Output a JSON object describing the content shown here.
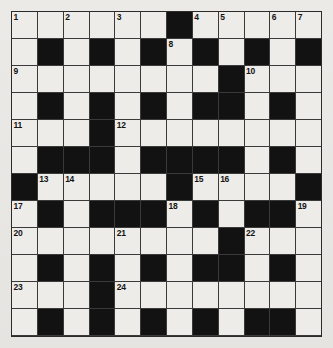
{
  "puzzle": {
    "title": "Crossword Grid",
    "type": "crossword",
    "rows": 12,
    "columns": 12,
    "colors": {
      "paper": "#e9e7e3",
      "cell_fill": "#eeece8",
      "block_fill": "#121212",
      "grid_line": "#3a3a3a",
      "border": "#2b2b2b",
      "number_text": "#141414"
    },
    "legend": {
      "block_symbol": "#",
      "open_symbol": "."
    },
    "grid": [
      "......#.....",
      ".#.#.#.#.#.#",
      "........#...",
      ".#.#.#.#.#.#",
      "...#........",
      ".###.#.###.#",
      "#.....#.....",
      ".#.###.#.##.",
      "........#...",
      ".#.#.#.##.#.",
      "...#........",
      ".#.#.#.#.#.#",
      "......#....."
    ],
    "grid_rows": [
      {
        "row": 1,
        "cells": ".....   ",
        "pattern": "......#....."
      },
      {
        "row": 2,
        "pattern": ".#.#.#.#.#.#"
      },
      {
        "row": 3,
        "pattern": "........#..."
      },
      {
        "row": 4,
        "pattern": ".#.#.#.#.#.#"
      },
      {
        "row": 5,
        "pattern": "...#........"
      },
      {
        "row": 6,
        "pattern": ".###.#.###.#"
      },
      {
        "row": 7,
        "pattern": "#.....#.....#"
      },
      {
        "row": 8,
        "pattern": ".#.###.#.##."
      },
      {
        "row": 9,
        "pattern": "........#..."
      },
      {
        "row": 10,
        "pattern": ".#.#.#.##.#."
      },
      {
        "row": 11,
        "pattern": "...#........"
      },
      {
        "row": 12,
        "pattern": "......#....."
      }
    ],
    "numbers": [
      {
        "n": 1,
        "row": 1,
        "col": 1
      },
      {
        "n": 2,
        "row": 1,
        "col": 3
      },
      {
        "n": 3,
        "row": 1,
        "col": 5
      },
      {
        "n": 4,
        "row": 1,
        "col": 8
      },
      {
        "n": 5,
        "row": 1,
        "col": 9
      },
      {
        "n": 6,
        "row": 1,
        "col": 11
      },
      {
        "n": 7,
        "row": 1,
        "col": 13
      },
      {
        "n": 8,
        "row": 2,
        "col": 7
      },
      {
        "n": 9,
        "row": 3,
        "col": 1
      },
      {
        "n": 10,
        "row": 3,
        "col": 11
      },
      {
        "n": 11,
        "row": 5,
        "col": 1
      },
      {
        "n": 12,
        "row": 5,
        "col": 5
      },
      {
        "n": 13,
        "row": 7,
        "col": 2
      },
      {
        "n": 14,
        "row": 7,
        "col": 3
      },
      {
        "n": 15,
        "row": 7,
        "col": 8
      },
      {
        "n": 16,
        "row": 7,
        "col": 9
      },
      {
        "n": 17,
        "row": 8,
        "col": 1
      },
      {
        "n": 18,
        "row": 8,
        "col": 7
      },
      {
        "n": 19,
        "row": 8,
        "col": 12
      },
      {
        "n": 20,
        "row": 9,
        "col": 1
      },
      {
        "n": 21,
        "row": 9,
        "col": 5
      },
      {
        "n": 22,
        "row": 9,
        "col": 10
      },
      {
        "n": 23,
        "row": 11,
        "col": 1
      },
      {
        "n": 24,
        "row": 11,
        "col": 5
      },
      {
        "n": 25,
        "row": 12,
        "col": 1
      },
      {
        "n": 26,
        "row": 12,
        "col": 8
      }
    ],
    "cells": [
      [
        {
          "b": false,
          "n": "1"
        },
        {
          "b": false
        },
        {
          "b": false,
          "n": "2"
        },
        {
          "b": false
        },
        {
          "b": false,
          "n": "3"
        },
        {
          "b": false
        },
        {
          "b": true
        },
        {
          "b": false,
          "n": "4"
        },
        {
          "b": false,
          "n": "5"
        },
        {
          "b": false
        },
        {
          "b": false,
          "n": "6"
        },
        {
          "b": false,
          "n": "7"
        }
      ],
      [
        {
          "b": false
        },
        {
          "b": true
        },
        {
          "b": false
        },
        {
          "b": true
        },
        {
          "b": false
        },
        {
          "b": true
        },
        {
          "b": false,
          "n": "8"
        },
        {
          "b": true
        },
        {
          "b": false
        },
        {
          "b": true
        },
        {
          "b": false
        },
        {
          "b": true
        }
      ],
      [
        {
          "b": false,
          "n": "9"
        },
        {
          "b": false
        },
        {
          "b": false
        },
        {
          "b": false
        },
        {
          "b": false
        },
        {
          "b": false
        },
        {
          "b": false
        },
        {
          "b": false
        },
        {
          "b": true
        },
        {
          "b": false,
          "n": "10"
        },
        {
          "b": false
        },
        {
          "b": false
        }
      ],
      [
        {
          "b": false
        },
        {
          "b": true
        },
        {
          "b": false
        },
        {
          "b": true
        },
        {
          "b": false
        },
        {
          "b": true
        },
        {
          "b": false
        },
        {
          "b": true
        },
        {
          "b": true
        },
        {
          "b": false
        },
        {
          "b": true
        },
        {
          "b": false
        }
      ],
      [
        {
          "b": false,
          "n": "11"
        },
        {
          "b": false
        },
        {
          "b": false
        },
        {
          "b": true
        },
        {
          "b": false,
          "n": "12"
        },
        {
          "b": false
        },
        {
          "b": false
        },
        {
          "b": false
        },
        {
          "b": false
        },
        {
          "b": false
        },
        {
          "b": false
        },
        {
          "b": false
        }
      ],
      [
        {
          "b": false
        },
        {
          "b": true
        },
        {
          "b": true
        },
        {
          "b": true
        },
        {
          "b": false
        },
        {
          "b": true
        },
        {
          "b": true
        },
        {
          "b": true
        },
        {
          "b": true
        },
        {
          "b": false
        },
        {
          "b": true
        },
        {
          "b": false
        }
      ],
      [
        {
          "b": true
        },
        {
          "b": false,
          "n": "13"
        },
        {
          "b": false,
          "n": "14"
        },
        {
          "b": false
        },
        {
          "b": false
        },
        {
          "b": false
        },
        {
          "b": true
        },
        {
          "b": false,
          "n": "15"
        },
        {
          "b": false,
          "n": "16"
        },
        {
          "b": false
        },
        {
          "b": false
        },
        {
          "b": true
        }
      ],
      [
        {
          "b": false,
          "n": "17"
        },
        {
          "b": true
        },
        {
          "b": false
        },
        {
          "b": true
        },
        {
          "b": true
        },
        {
          "b": true
        },
        {
          "b": false,
          "n": "18"
        },
        {
          "b": true
        },
        {
          "b": false
        },
        {
          "b": true
        },
        {
          "b": true
        },
        {
          "b": false,
          "n": "19"
        }
      ],
      [
        {
          "b": false,
          "n": "20"
        },
        {
          "b": false
        },
        {
          "b": false
        },
        {
          "b": false
        },
        {
          "b": false,
          "n": "21"
        },
        {
          "b": false
        },
        {
          "b": false
        },
        {
          "b": false
        },
        {
          "b": true
        },
        {
          "b": false,
          "n": "22"
        },
        {
          "b": false
        },
        {
          "b": false
        }
      ],
      [
        {
          "b": false
        },
        {
          "b": true
        },
        {
          "b": false
        },
        {
          "b": true
        },
        {
          "b": false
        },
        {
          "b": true
        },
        {
          "b": false
        },
        {
          "b": true
        },
        {
          "b": true
        },
        {
          "b": false
        },
        {
          "b": true
        },
        {
          "b": false
        }
      ],
      [
        {
          "b": false,
          "n": "23"
        },
        {
          "b": false
        },
        {
          "b": false
        },
        {
          "b": true
        },
        {
          "b": false,
          "n": "24"
        },
        {
          "b": false
        },
        {
          "b": false
        },
        {
          "b": false
        },
        {
          "b": false
        },
        {
          "b": false
        },
        {
          "b": false
        },
        {
          "b": false
        }
      ],
      [
        {
          "b": false
        },
        {
          "b": true
        },
        {
          "b": false
        },
        {
          "b": true
        },
        {
          "b": false
        },
        {
          "b": true
        },
        {
          "b": false
        },
        {
          "b": true
        },
        {
          "b": false
        },
        {
          "b": true
        },
        {
          "b": true
        },
        {
          "b": false
        }
      ],
      [
        {
          "b": false,
          "n": "25"
        },
        {
          "b": false
        },
        {
          "b": false
        },
        {
          "b": false
        },
        {
          "b": false
        },
        {
          "b": false
        },
        {
          "b": true
        },
        {
          "b": false,
          "n": "26"
        },
        {
          "b": false
        },
        {
          "b": false
        },
        {
          "b": false
        },
        {
          "b": false
        }
      ]
    ]
  }
}
